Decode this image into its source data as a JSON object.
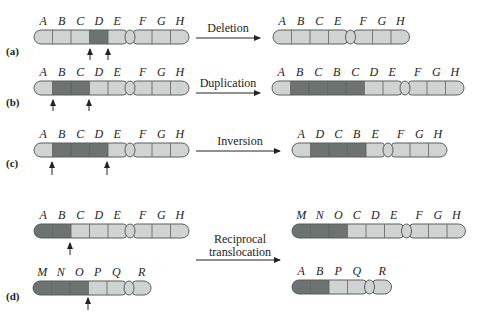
{
  "colors": {
    "light": "#cfd3d2",
    "dark": "#6d7371",
    "outline": "#5a5e5d",
    "text": "#222222"
  },
  "panels": [
    {
      "label": "(a)",
      "operation": "Deletion",
      "before": [
        {
          "genes": [
            "A",
            "B",
            "C",
            "D",
            "E"
          ],
          "shades": [
            "light",
            "light",
            "light",
            "dark",
            "light"
          ]
        },
        {
          "genes": [
            "F",
            "G",
            "H"
          ],
          "shades": [
            "light",
            "light",
            "light"
          ]
        }
      ],
      "after": [
        {
          "genes": [
            "A",
            "B",
            "C",
            "E"
          ],
          "shades": [
            "light",
            "light",
            "light",
            "light"
          ]
        },
        {
          "genes": [
            "F",
            "G",
            "H"
          ],
          "shades": [
            "light",
            "light",
            "light"
          ]
        }
      ],
      "breakpoint_arrows": 2
    },
    {
      "label": "(b)",
      "operation": "Duplication",
      "before": [
        {
          "genes": [
            "A",
            "B",
            "C",
            "D",
            "E"
          ],
          "shades": [
            "light",
            "dark",
            "dark",
            "light",
            "light"
          ]
        },
        {
          "genes": [
            "F",
            "G",
            "H"
          ],
          "shades": [
            "light",
            "light",
            "light"
          ]
        }
      ],
      "after": [
        {
          "genes": [
            "A",
            "B",
            "C",
            "B",
            "C",
            "D",
            "E"
          ],
          "shades": [
            "light",
            "dark",
            "dark",
            "dark",
            "dark",
            "light",
            "light"
          ]
        },
        {
          "genes": [
            "F",
            "G",
            "H"
          ],
          "shades": [
            "light",
            "light",
            "light"
          ]
        }
      ],
      "breakpoint_arrows": 2
    },
    {
      "label": "(c)",
      "operation": "Inversion",
      "before": [
        {
          "genes": [
            "A",
            "B",
            "C",
            "D",
            "E"
          ],
          "shades": [
            "light",
            "dark",
            "dark",
            "dark",
            "light"
          ]
        },
        {
          "genes": [
            "F",
            "G",
            "H"
          ],
          "shades": [
            "light",
            "light",
            "light"
          ]
        }
      ],
      "after": [
        {
          "genes": [
            "A",
            "D",
            "C",
            "B",
            "E"
          ],
          "shades": [
            "light",
            "dark",
            "dark",
            "dark",
            "light"
          ]
        },
        {
          "genes": [
            "F",
            "G",
            "H"
          ],
          "shades": [
            "light",
            "light",
            "light"
          ]
        }
      ],
      "breakpoint_arrows": 2
    },
    {
      "label": "(d)",
      "operation_line1": "Reciprocal",
      "operation_line2": "translocation",
      "before_top": [
        {
          "genes": [
            "A",
            "B",
            "C",
            "D",
            "E"
          ],
          "shades": [
            "dark",
            "dark",
            "light",
            "light",
            "light"
          ]
        },
        {
          "genes": [
            "F",
            "G",
            "H"
          ],
          "shades": [
            "light",
            "light",
            "light"
          ]
        }
      ],
      "before_bottom": [
        {
          "genes": [
            "M",
            "N",
            "O",
            "P",
            "Q"
          ],
          "shades": [
            "dark",
            "dark",
            "dark",
            "light",
            "light"
          ]
        },
        {
          "genes": [
            "R"
          ],
          "shades": [
            "light"
          ]
        }
      ],
      "after_top": [
        {
          "genes": [
            "M",
            "N",
            "O",
            "C",
            "D",
            "E"
          ],
          "shades": [
            "dark",
            "dark",
            "dark",
            "light",
            "light",
            "light"
          ]
        },
        {
          "genes": [
            "F",
            "G",
            "H"
          ],
          "shades": [
            "light",
            "light",
            "light"
          ]
        }
      ],
      "after_bottom": [
        {
          "genes": [
            "A",
            "B",
            "P",
            "Q"
          ],
          "shades": [
            "dark",
            "dark",
            "light",
            "light"
          ]
        },
        {
          "genes": [
            "R"
          ],
          "shades": [
            "light"
          ]
        }
      ],
      "breakpoint_arrows": 2
    }
  ]
}
